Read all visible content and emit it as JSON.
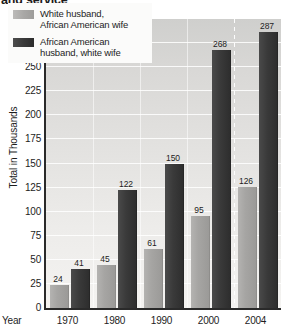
{
  "title": {
    "text": "and service",
    "clipped": true
  },
  "axis": {
    "ylabel": "Total in Thousands",
    "xlabel": "Year"
  },
  "legend": {
    "items": [
      {
        "label_line1": "White husband,",
        "label_line2": "African American wife",
        "color": "#a9a8a6",
        "swatch": "light-gray-swatch"
      },
      {
        "label_line1": "African American",
        "label_line2": "husband, white wife",
        "color": "#3a3a3a",
        "swatch": "dark-gray-swatch"
      }
    ]
  },
  "chart_data": {
    "type": "bar",
    "title": "and service",
    "xlabel": "Year",
    "ylabel": "Total in Thousands",
    "categories": [
      "1970",
      "1980",
      "1990",
      "2000",
      "2004"
    ],
    "series": [
      {
        "name": "White husband, African American wife",
        "color": "#a9a8a6",
        "values": [
          24,
          45,
          61,
          95,
          126
        ]
      },
      {
        "name": "African American husband, white wife",
        "color": "#3a3a3a",
        "values": [
          41,
          122,
          150,
          268,
          287
        ]
      }
    ],
    "ylim": [
      0,
      300
    ],
    "yticks": [
      0,
      25,
      50,
      75,
      100,
      125,
      150,
      175,
      200,
      225,
      250,
      275,
      300
    ],
    "ytick_labels": [
      "0",
      "25",
      "50",
      "75",
      "100",
      "125",
      "150",
      "175",
      "200",
      "225",
      "250",
      "275",
      "300"
    ],
    "grid": true,
    "grid_axis": "y",
    "legend_position": "upper-left-inside",
    "data_labels": true,
    "units": "thousands"
  }
}
